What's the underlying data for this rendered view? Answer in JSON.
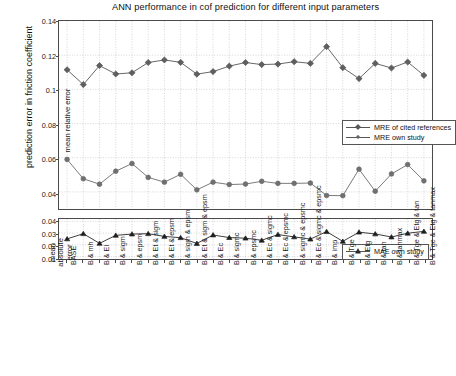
{
  "figure": {
    "title": "ANN performance in cof prediction for different input parameters",
    "global_ylabel": "prediction error in friction coefficient"
  },
  "subplot_top": {
    "ylabel": "mean relative error",
    "yticks": [
      "0.14",
      "0.12",
      "0.1",
      "0.08",
      "0.06",
      "0.04"
    ],
    "legend": [
      "MRE of cited references",
      "MRE own study"
    ]
  },
  "subplot_bottom": {
    "ylabel_line1": "mean",
    "ylabel_line2": "absolute",
    "ylabel_line3": "error",
    "yticks": [
      "0.04",
      "0.03",
      "0.02",
      "0.01"
    ],
    "legend": [
      "MAE own study"
    ]
  },
  "chart_data": [
    {
      "type": "line",
      "title": "ANN performance in cof prediction for different input parameters",
      "xlabel": "",
      "ylabel": "mean relative error",
      "ylim": [
        0.03,
        0.14
      ],
      "yticks": [
        0.04,
        0.06,
        0.08,
        0.1,
        0.12,
        0.14
      ],
      "grid": true,
      "legend_position": "center-right",
      "categories": [
        "BASE",
        "B & mh",
        "B & El",
        "B & sigm",
        "B & epsm",
        "B & Et & sigm",
        "B & Et & epsm",
        "B & sigm & epsm",
        "B & Et & sigm & epsm",
        "B & Ec",
        "B & sigmc",
        "B & epsmc",
        "B & Ec & sigmc",
        "B & Ec & epsmc",
        "B & sigmc & epsmc",
        "B & Ec & sigmc & epsmc",
        "B & imp",
        "B & Tge",
        "B & Etg",
        "B & tan",
        "B & tanmax",
        "B & Tge & Etg & tan",
        "B & Tge & Etg & tanmax"
      ],
      "series": [
        {
          "name": "MRE of cited references",
          "values": [
            0.1115,
            0.1028,
            0.1139,
            0.109,
            0.1097,
            0.1157,
            0.1172,
            0.1158,
            0.1089,
            0.1104,
            0.1136,
            0.1157,
            0.1145,
            0.1148,
            0.1162,
            0.1152,
            0.125,
            0.1127,
            0.1063,
            0.1152,
            0.1125,
            0.116,
            0.1082
          ]
        },
        {
          "name": "MRE own study",
          "values": [
            0.059,
            0.0477,
            0.0445,
            0.0521,
            0.0566,
            0.0485,
            0.0457,
            0.0503,
            0.0412,
            0.0457,
            0.0443,
            0.0446,
            0.0462,
            0.045,
            0.045,
            0.0452,
            0.0379,
            0.0378,
            0.0533,
            0.0404,
            0.0505,
            0.056,
            0.0465
          ]
        }
      ]
    },
    {
      "type": "line",
      "title": "",
      "xlabel": "",
      "ylabel": "mean absolute error",
      "ylim": [
        0.008,
        0.042
      ],
      "yticks": [
        0.01,
        0.02,
        0.03,
        0.04
      ],
      "grid": true,
      "legend_position": "bottom-right",
      "categories": [
        "BASE",
        "B & mh",
        "B & El",
        "B & sigm",
        "B & epsm",
        "B & Et & sigm",
        "B & Et & epsm",
        "B & sigm & epsm",
        "B & Et & sigm & epsm",
        "B & Ec",
        "B & sigmc",
        "B & epsmc",
        "B & Ec & sigmc",
        "B & Ec & epsmc",
        "B & sigmc & epsmc",
        "B & Ec & sigmc & epsmc",
        "B & imp",
        "B & Tge",
        "B & Etg",
        "B & tan",
        "B & tanmax",
        "B & Tge & Etg & tan",
        "B & Tge & Etg & tanmax"
      ],
      "series": [
        {
          "name": "MAE own study",
          "values": [
            0.0251,
            0.0295,
            0.0213,
            0.0281,
            0.0292,
            0.0295,
            0.0272,
            0.0261,
            0.0212,
            0.0284,
            0.0262,
            0.0257,
            0.0239,
            0.0288,
            0.0268,
            0.0249,
            0.0313,
            0.023,
            0.0308,
            0.0293,
            0.0267,
            0.0299,
            0.0315
          ]
        }
      ]
    }
  ]
}
